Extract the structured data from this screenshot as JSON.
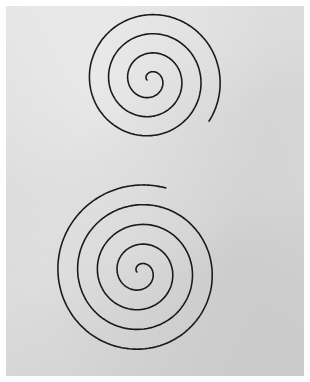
{
  "image": {
    "subject": "Two hand-stitched black thread spirals on white fabric",
    "background_color": "#dadada",
    "border_color": "#ffffff",
    "thread_color": "#1a1a1a",
    "spirals": [
      {
        "name": "top-spiral",
        "cx": 150,
        "cy": 80,
        "turns": 3.6,
        "outer_radius": 72
      },
      {
        "name": "bottom-spiral",
        "cx": 140,
        "cy": 272,
        "turns": 4.3,
        "outer_radius": 88
      }
    ]
  }
}
